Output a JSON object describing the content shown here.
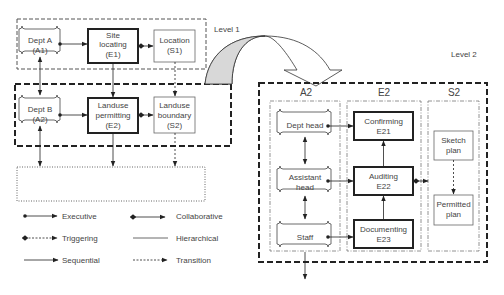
{
  "level1": {
    "label": "Level 1",
    "nodes": {
      "deptA": {
        "line1": "Dept A",
        "line2": "(A1)"
      },
      "site": {
        "line1": "Site",
        "line2": "locating",
        "line3": "(E1)"
      },
      "location": {
        "line1": "Location",
        "line2": "(S1)"
      },
      "deptB": {
        "line1": "Dept B",
        "line2": "(A2)"
      },
      "landuse_perm": {
        "line1": "Landuse",
        "line2": "permitting",
        "line3": "(E2)"
      },
      "landuse_bound": {
        "line1": "Landuse",
        "line2": "boundary",
        "line3": "(S2)"
      }
    }
  },
  "level2": {
    "label": "Level 2",
    "columns": [
      "A2",
      "E2",
      "S2"
    ],
    "nodes": {
      "dept_head": {
        "line1": "Dept head"
      },
      "assistant_head": {
        "line1": "Assistant",
        "line2": "head"
      },
      "staff": {
        "line1": "Staff"
      },
      "confirming": {
        "line1": "Confirming",
        "line2": "E21"
      },
      "auditing": {
        "line1": "Auditing",
        "line2": "E22"
      },
      "documenting": {
        "line1": "Documenting",
        "line2": "E23"
      },
      "sketch": {
        "line1": "Sketch",
        "line2": "plan"
      },
      "permitted": {
        "line1": "Permitted",
        "line2": "plan"
      }
    }
  },
  "legend": [
    {
      "label": "Executive"
    },
    {
      "label": "Collaborative"
    },
    {
      "label": "Triggering"
    },
    {
      "label": "Hierarchical"
    },
    {
      "label": "Sequential"
    },
    {
      "label": "Transition"
    }
  ]
}
